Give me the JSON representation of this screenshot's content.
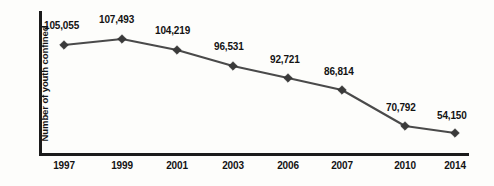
{
  "chart_data": {
    "type": "line",
    "title": "",
    "subtitle": "",
    "xlabel": "",
    "ylabel": "Number of youth confined",
    "categories": [
      "1997",
      "1999",
      "2001",
      "2003",
      "2006",
      "2007",
      "2010",
      "2014"
    ],
    "values": [
      105055,
      107493,
      104219,
      96531,
      92721,
      86814,
      70792,
      54150
    ],
    "value_labels": [
      "105,055",
      "107,493",
      "104,219",
      "96,531",
      "92,721",
      "86,814",
      "70,792",
      "54,150"
    ],
    "ylim": [
      0,
      120000
    ],
    "grid": false,
    "legend": false,
    "legend_position": "none",
    "marker": "diamond",
    "line_color": "#4a4a4a",
    "marker_color": "#3a3a3a",
    "axis_color": "#1b1b1b",
    "background_color": "#fdfdfb",
    "series": [
      {
        "name": "Number of youth confined",
        "values": [
          105055,
          107493,
          104219,
          96531,
          92721,
          86814,
          70792,
          54150
        ]
      }
    ],
    "points": [
      {
        "year": "1997",
        "label": "105,055",
        "value": 105055,
        "px": 64,
        "py": 45,
        "lx": 44,
        "ly": 20
      },
      {
        "year": "1999",
        "label": "107,493",
        "value": 107493,
        "px": 122,
        "py": 39,
        "lx": 99,
        "ly": 14
      },
      {
        "year": "2001",
        "label": "104,219",
        "value": 104219,
        "px": 177,
        "py": 50,
        "lx": 155,
        "ly": 25
      },
      {
        "year": "2003",
        "label": "96,531",
        "value": 96531,
        "px": 233,
        "py": 66,
        "lx": 214,
        "ly": 41
      },
      {
        "year": "2006",
        "label": "92,721",
        "value": 92721,
        "px": 288,
        "py": 78,
        "lx": 270,
        "ly": 54
      },
      {
        "year": "2007",
        "label": "86,814",
        "value": 86814,
        "px": 342,
        "py": 90,
        "lx": 324,
        "ly": 66
      },
      {
        "year": "2010",
        "label": "70,792",
        "value": 70792,
        "px": 405,
        "py": 126,
        "lx": 386,
        "ly": 102
      },
      {
        "year": "2014",
        "label": "54,150",
        "value": 54150,
        "px": 455,
        "py": 133,
        "lx": 437,
        "ly": 110
      }
    ]
  }
}
